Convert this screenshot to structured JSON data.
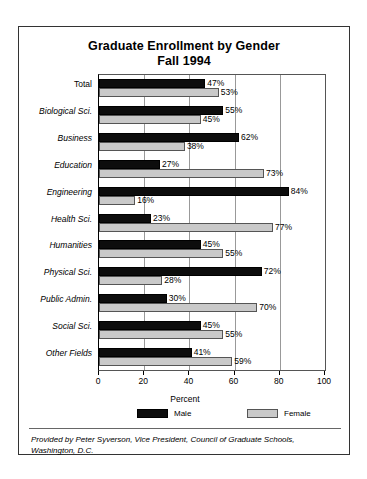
{
  "chart_data": {
    "type": "bar",
    "orientation": "horizontal",
    "title": "Graduate Enrollment by Gender",
    "subtitle": "Fall 1994",
    "xlabel": "Percent",
    "ylabel": "",
    "xlim": [
      0,
      100
    ],
    "xticks": [
      0,
      20,
      40,
      60,
      80,
      100
    ],
    "xticklabels": [
      "0",
      "20",
      "40",
      "60",
      "80",
      "100"
    ],
    "grid": true,
    "legend_position": "bottom",
    "categories": [
      "Total",
      "Biological Sci.",
      "Business",
      "Education",
      "Engineering",
      "Health Sci.",
      "Humanities",
      "Physical Sci.",
      "Public Admin.",
      "Social Sci.",
      "Other Fields"
    ],
    "series": [
      {
        "name": "Male",
        "color": "#0d0d0d",
        "values": [
          47,
          55,
          62,
          27,
          84,
          23,
          45,
          72,
          30,
          45,
          41
        ],
        "labels": [
          "47%",
          "55%",
          "62%",
          "27%",
          "84%",
          "23%",
          "45%",
          "72%",
          "30%",
          "45%",
          "41%"
        ]
      },
      {
        "name": "Female",
        "color": "#c9c9c9",
        "values": [
          53,
          45,
          38,
          73,
          16,
          77,
          55,
          28,
          70,
          55,
          59
        ],
        "labels": [
          "53%",
          "45%",
          "38%",
          "73%",
          "16%",
          "77%",
          "55%",
          "28%",
          "70%",
          "55%",
          "59%"
        ]
      }
    ],
    "footnote": "Provided by Peter Syverson, Vice President, Council of Graduate Schools, Washington, D.C."
  }
}
